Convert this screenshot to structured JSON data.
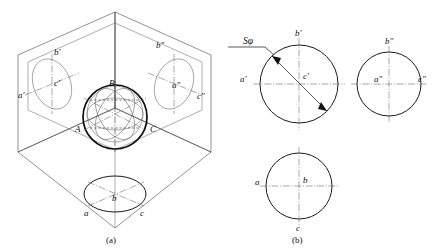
{
  "figure": {
    "captions": {
      "left": "(a)",
      "right": "(b)"
    }
  },
  "part_a": {
    "name": "isometric-projection-box",
    "description": "Sphere placed inside three mutually perpendicular projection planes with its three projections shown as ellipses on the tilted planes",
    "sphere_labels": {
      "top": "B",
      "left": "A",
      "right": "C"
    },
    "v_plane_ellipse_labels": {
      "top": "b'",
      "center": "c'",
      "left": "a'"
    },
    "w_plane_ellipse_labels": {
      "top": "b″",
      "center": "a″",
      "right": "c″"
    },
    "h_plane_ellipse_labels": {
      "left": "a",
      "center": "b",
      "right": "c"
    }
  },
  "part_b": {
    "name": "three-view-orthographic-projection",
    "dimension": {
      "label": "Sφ",
      "meaning": "spherical diameter"
    },
    "front_view": {
      "name": "front-view-circle",
      "labels": {
        "top": "b'",
        "left": "a'",
        "center": "c'"
      }
    },
    "side_view": {
      "name": "side-view-circle",
      "labels": {
        "top": "b″",
        "center": "a″",
        "right": "c″"
      }
    },
    "top_view": {
      "name": "top-view-circle",
      "labels": {
        "left": "a",
        "center": "b",
        "bottom": "c"
      }
    }
  },
  "colors": {
    "outline": "#0f0f0f",
    "thin_line": "#4a4a4a",
    "center_line": "#6e6e6e",
    "background": "#ffffff"
  }
}
